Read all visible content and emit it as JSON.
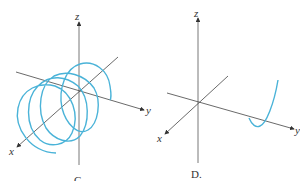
{
  "figures": [
    {
      "caption": "C",
      "axes": {
        "x": "x",
        "y": "y",
        "z": "z"
      },
      "curve": "helix around x-axis",
      "curve_color": "#4ab3d8"
    },
    {
      "caption": "D.",
      "axes": {
        "x": "x",
        "y": "y",
        "z": "z"
      },
      "curve": "parabola-like curve near y-axis",
      "curve_color": "#4ab3d8"
    }
  ],
  "colors": {
    "axis": "#333333",
    "curve": "#4ab3d8"
  }
}
